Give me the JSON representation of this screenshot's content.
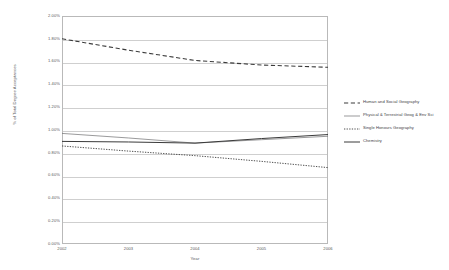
{
  "chart_data": {
    "type": "line",
    "title": "",
    "xlabel": "Year",
    "ylabel": "% of Total Degree Acceptances",
    "x": [
      "2002",
      "2003",
      "2004",
      "2005",
      "2006"
    ],
    "ylim": [
      0.0,
      2.0
    ],
    "ytick_values": [
      2.0,
      1.8,
      1.6,
      1.4,
      1.2,
      1.0,
      0.8,
      0.6,
      0.4,
      0.2,
      0.0
    ],
    "ytick_labels": [
      "2.00%",
      "1.80%",
      "1.60%",
      "1.40%",
      "1.20%",
      "1.00%",
      "0.80%",
      "0.60%",
      "0.40%",
      "0.20%",
      "0.00%"
    ],
    "grid": "horizontal",
    "legend_position": "right",
    "series": [
      {
        "name": "Human and Social Geography",
        "style": "dashed",
        "color": "#3a3a3a",
        "width": 1.1,
        "values": [
          1.8,
          1.7,
          1.61,
          1.57,
          1.55
        ]
      },
      {
        "name": "Physical & Terrestrial Geog & Env Sci",
        "style": "solid",
        "color": "#6e6e70",
        "width": 0.7,
        "values": [
          0.97,
          0.93,
          0.885,
          0.915,
          0.945
        ]
      },
      {
        "name": "Single Honours Geography",
        "style": "dotted",
        "color": "#3a3a3a",
        "width": 0.9,
        "values": [
          0.86,
          0.815,
          0.775,
          0.725,
          0.67
        ]
      },
      {
        "name": "Chemistry",
        "style": "solid",
        "color": "#3a3a3a",
        "width": 1.0,
        "values": [
          0.9,
          0.895,
          0.885,
          0.925,
          0.96
        ]
      }
    ]
  },
  "legend": {
    "items": [
      {
        "label": "Human and Social Geography"
      },
      {
        "label": "Physical & Terrestrial Geog & Env Sci"
      },
      {
        "label": "Single Honours Geography"
      },
      {
        "label": "Chemistry"
      }
    ]
  },
  "colors": {
    "plot_border": "#b9b9b9",
    "gridline": "#cfcfcf",
    "axis_text": "#58585a",
    "legend_text": "#3d3d3f",
    "background": "#ffffff"
  }
}
